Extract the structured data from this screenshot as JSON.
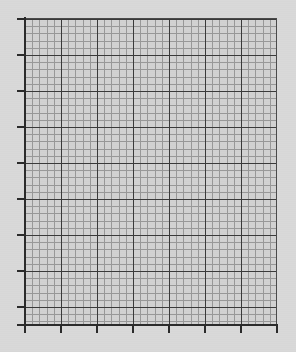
{
  "figure": {
    "type": "blank-grid-plot",
    "width": 296,
    "height": 352,
    "background_color": "#d9d9d9",
    "plot_background_color": "#d2d2d2",
    "title": "",
    "has_data_series": false,
    "has_legend": false,
    "has_tick_labels": false
  },
  "chart_data": {
    "type": "line",
    "title": "",
    "subtitle": "",
    "xlabel": "",
    "ylabel": "",
    "series": [],
    "categories": [],
    "x": [],
    "values": [],
    "xlim": [
      0,
      7
    ],
    "ylim": [
      0,
      8.5
    ],
    "grid": true,
    "minor_grid": true,
    "legend": false,
    "legend_position": "none",
    "annotations": [],
    "xtick_labels": [],
    "ytick_labels": []
  },
  "axes": {
    "plot_box": {
      "left": 25,
      "top": 19,
      "width": 252,
      "height": 306
    },
    "grid": {
      "minor_spacing_px": 7.2,
      "major_spacing_px": 36,
      "minor_color": "#8f8f8f",
      "major_color": "#3a3a3a",
      "spine_color": "#2b2b2b"
    },
    "y_ticks": [
      {
        "name": "y-tick-0",
        "y": 18
      },
      {
        "name": "y-tick-1",
        "y": 54
      },
      {
        "name": "y-tick-2",
        "y": 90
      },
      {
        "name": "y-tick-3",
        "y": 126
      },
      {
        "name": "y-tick-4",
        "y": 162
      },
      {
        "name": "y-tick-5",
        "y": 198
      },
      {
        "name": "y-tick-6",
        "y": 234
      },
      {
        "name": "y-tick-7",
        "y": 270
      },
      {
        "name": "y-tick-8",
        "y": 306
      },
      {
        "name": "y-tick-9",
        "y": 324
      }
    ],
    "x_ticks": [
      {
        "name": "x-tick-0",
        "x": 24
      },
      {
        "name": "x-tick-1",
        "x": 60
      },
      {
        "name": "x-tick-2",
        "x": 96
      },
      {
        "name": "x-tick-3",
        "x": 132
      },
      {
        "name": "x-tick-4",
        "x": 168
      },
      {
        "name": "x-tick-5",
        "x": 204
      },
      {
        "name": "x-tick-6",
        "x": 240
      },
      {
        "name": "x-tick-7",
        "x": 276
      }
    ]
  }
}
